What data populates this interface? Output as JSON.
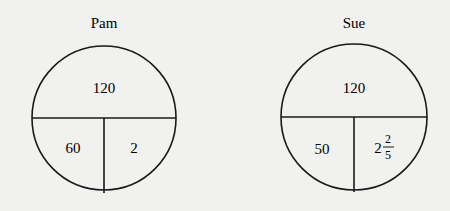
{
  "diagrams": [
    {
      "title": "Pam",
      "top": "120",
      "bottom_left": "60",
      "bottom_right": {
        "whole": "2",
        "numerator": "",
        "denominator": ""
      }
    },
    {
      "title": "Sue",
      "top": "120",
      "bottom_left": "50",
      "bottom_right": {
        "whole": "2",
        "numerator": "2",
        "denominator": "5"
      }
    }
  ],
  "colors": {
    "background": "#f1f1ef",
    "stroke": "#1a1a1a"
  }
}
